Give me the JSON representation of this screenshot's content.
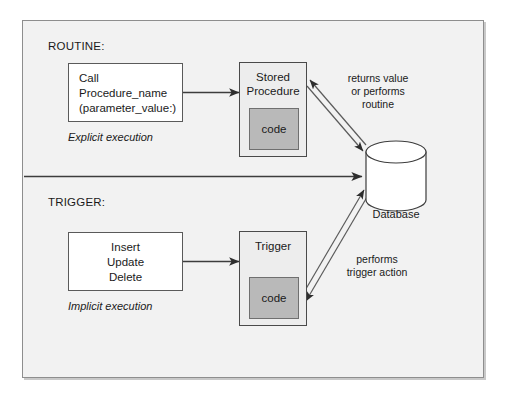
{
  "diagram": {
    "title_routine": "ROUTINE:",
    "title_trigger": "TRIGGER:"
  },
  "routine": {
    "label": "ROUTINE:",
    "call_box": {
      "line1": "Call",
      "line2": "Procedure_name",
      "line3": "(parameter_value:)"
    },
    "execution_note": "Explicit execution",
    "procedure_box": {
      "title_line1": "Stored",
      "title_line2": "Procedure",
      "code_label": "code"
    },
    "return_edge_label": {
      "line1": "returns value",
      "line2": "or performs",
      "line3": "routine"
    }
  },
  "trigger": {
    "label": "TRIGGER:",
    "event_box": {
      "line1": "Insert",
      "line2": "Update",
      "line3": "Delete"
    },
    "execution_note": "Implicit execution",
    "trigger_box": {
      "title": "Trigger",
      "code_label": "code"
    },
    "action_edge_label": {
      "line1": "performs",
      "line2": "trigger action"
    }
  },
  "database": {
    "label": "Database"
  },
  "colors": {
    "background": "#f2f2f2",
    "frame_border": "#8e8e8e",
    "box_border": "#5a5a5a",
    "procedure_fill": "#ededed",
    "code_fill": "#b9b9b9",
    "line": "#3d3d3d",
    "text": "#1a1a1a"
  }
}
